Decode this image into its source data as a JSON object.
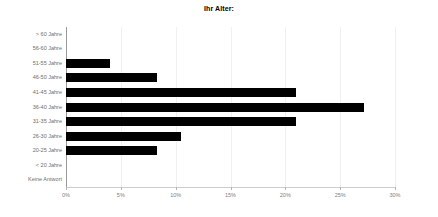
{
  "chart_data": {
    "type": "bar",
    "orientation": "horizontal",
    "title": "Ihr Alter:",
    "xlabel": "",
    "ylabel": "",
    "xlim": [
      0,
      30
    ],
    "xticks": [
      0,
      5,
      10,
      15,
      20,
      25,
      30
    ],
    "xtick_labels": [
      "0%",
      "5%",
      "10%",
      "15%",
      "20%",
      "25%",
      "30%"
    ],
    "grid": true,
    "legend": "none",
    "unit": "%",
    "categories": [
      "> 60 Jahre",
      "56-60 Jahre",
      "51-55 Jahre",
      "46-50 Jahre",
      "41-45 Jahre",
      "36-40 Jahre",
      "31-35 Jahre",
      "26-30 Jahre",
      "20-25 Jahre",
      "< 20 Jahre",
      "Keine Antwort"
    ],
    "values": [
      0,
      0,
      4.0,
      8.3,
      21.0,
      27.2,
      21.0,
      10.5,
      8.3,
      0,
      0
    ],
    "bar_color": "#000000",
    "axis_color": "#9a9a9a",
    "grid_color": "#f0f0f0",
    "tick_label_color": "#808080",
    "category_label_color": "#6e6e6e"
  }
}
